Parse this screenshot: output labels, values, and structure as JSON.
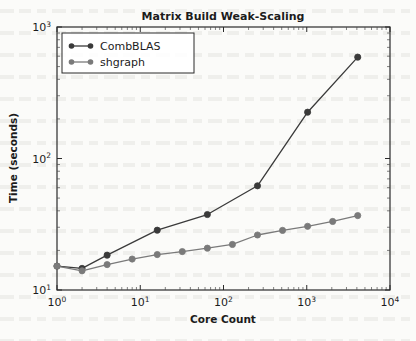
{
  "chart_data": {
    "type": "line",
    "title": "Matrix Build Weak-Scaling",
    "xlabel": "Core Count",
    "ylabel": "Time (seconds)",
    "xscale": "log",
    "yscale": "log",
    "xlim": [
      1,
      10000
    ],
    "ylim": [
      10,
      1000
    ],
    "grid": false,
    "legend_position": "upper left",
    "x_tick_labels": [
      "10^0",
      "10^1",
      "10^2",
      "10^3",
      "10^4"
    ],
    "x_tick_values": [
      1,
      10,
      100,
      1000,
      10000
    ],
    "y_tick_labels": [
      "10^1",
      "10^2",
      "10^3"
    ],
    "y_tick_values": [
      10,
      100,
      1000
    ],
    "series": [
      {
        "name": "CombBLAS",
        "color": "#3a3a3a",
        "marker": "circle",
        "x": [
          1,
          2,
          4,
          16,
          64,
          256,
          1024,
          4096
        ],
        "values": [
          15.2,
          14.6,
          18.4,
          28.5,
          37.5,
          62.0,
          225.0,
          590.0
        ]
      },
      {
        "name": "shgraph",
        "color": "#7a7a7a",
        "marker": "circle",
        "x": [
          1,
          2,
          4,
          8,
          16,
          32,
          64,
          128,
          256,
          512,
          1024,
          2048,
          4096
        ],
        "values": [
          15.2,
          14.0,
          15.6,
          17.2,
          18.6,
          19.6,
          20.8,
          22.2,
          26.2,
          28.4,
          30.5,
          33.2,
          36.8
        ]
      }
    ]
  },
  "legend": {
    "entries": [
      {
        "label": "CombBLAS"
      },
      {
        "label": "shgraph"
      }
    ]
  }
}
